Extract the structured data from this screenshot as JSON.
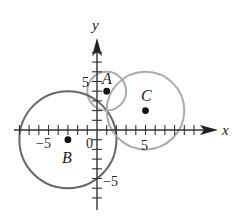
{
  "diagram": {
    "type": "coordinate-plane-circles",
    "axes": {
      "x_label": "x",
      "y_label": "y",
      "origin_label": "0",
      "tick_labels": {
        "x_neg": "−5",
        "x_pos": "5",
        "y_pos": "5",
        "y_neg": "−5"
      },
      "x_range": [
        -9,
        12
      ],
      "y_range": [
        -8,
        9
      ]
    },
    "points": [
      {
        "name": "A",
        "x": 1,
        "y": 4
      },
      {
        "name": "B",
        "x": -3,
        "y": -1
      },
      {
        "name": "C",
        "x": 5,
        "y": 2
      }
    ],
    "circles": [
      {
        "center": "A",
        "cx": 1,
        "cy": 4,
        "r": 2,
        "color": "#aaaaaa"
      },
      {
        "center": "B",
        "cx": -3,
        "cy": -1,
        "r": 5,
        "color": "#666666"
      },
      {
        "center": "C",
        "cx": 5,
        "cy": 2,
        "r": 4,
        "color": "#aaaaaa"
      }
    ]
  }
}
